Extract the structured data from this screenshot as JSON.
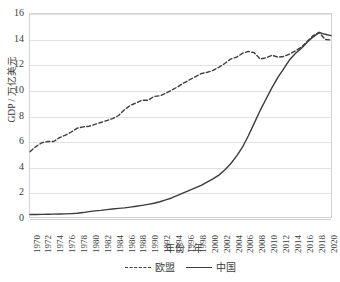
{
  "chart_data": {
    "type": "line",
    "title": "",
    "xlabel": "年份 / 年",
    "ylabel": "GDP / 万亿美元",
    "xlim": [
      1970,
      2021
    ],
    "ylim": [
      0,
      16
    ],
    "yticks": [
      0,
      2,
      4,
      6,
      8,
      10,
      12,
      14,
      16
    ],
    "grid": true,
    "legend_position": "bottom",
    "x": [
      1970,
      1971,
      1972,
      1973,
      1974,
      1975,
      1976,
      1977,
      1978,
      1979,
      1980,
      1981,
      1982,
      1983,
      1984,
      1985,
      1986,
      1987,
      1988,
      1989,
      1990,
      1991,
      1992,
      1993,
      1994,
      1995,
      1996,
      1997,
      1998,
      1999,
      2000,
      2001,
      2002,
      2003,
      2004,
      2005,
      2006,
      2007,
      2008,
      2009,
      2010,
      2011,
      2012,
      2013,
      2014,
      2015,
      2016,
      2017,
      2018,
      2019,
      2020,
      2021
    ],
    "xtick_labels": [
      "1970",
      "1972",
      "1974",
      "1976",
      "1978",
      "1980",
      "1982",
      "1984",
      "1986",
      "1988",
      "1990",
      "1992",
      "1994",
      "1996",
      "1998",
      "2000",
      "2002",
      "2004",
      "2006",
      "2008",
      "2010",
      "2012",
      "2014",
      "2016",
      "2018",
      "2020"
    ],
    "series": [
      {
        "name": "欧盟",
        "style": "dashed",
        "color": "#3b3b3b",
        "values": [
          5.15,
          5.55,
          5.85,
          5.95,
          5.95,
          6.25,
          6.45,
          6.7,
          7.0,
          7.1,
          7.15,
          7.3,
          7.45,
          7.6,
          7.75,
          8.0,
          8.45,
          8.8,
          9.0,
          9.2,
          9.2,
          9.5,
          9.55,
          9.75,
          10.0,
          10.25,
          10.55,
          10.8,
          11.05,
          11.3,
          11.4,
          11.55,
          11.8,
          12.1,
          12.45,
          12.6,
          12.9,
          13.05,
          12.95,
          12.45,
          12.55,
          12.75,
          12.6,
          12.65,
          12.85,
          13.1,
          13.4,
          13.85,
          14.3,
          14.55,
          14.0,
          13.95
        ]
      },
      {
        "name": "中国",
        "style": "solid",
        "color": "#3b3b3b",
        "values": [
          0.2,
          0.2,
          0.21,
          0.22,
          0.23,
          0.24,
          0.25,
          0.27,
          0.3,
          0.35,
          0.42,
          0.48,
          0.52,
          0.58,
          0.63,
          0.68,
          0.72,
          0.78,
          0.85,
          0.92,
          1.0,
          1.08,
          1.2,
          1.35,
          1.5,
          1.7,
          1.9,
          2.1,
          2.3,
          2.5,
          2.75,
          3.0,
          3.3,
          3.7,
          4.2,
          4.8,
          5.5,
          6.4,
          7.4,
          8.4,
          9.3,
          10.2,
          11.0,
          11.7,
          12.4,
          12.9,
          13.3,
          13.8,
          14.2,
          14.55,
          14.4,
          14.3
        ]
      }
    ]
  },
  "axes": {
    "y_title": "GDP / 万亿美元",
    "x_title": "年份 / 年"
  },
  "legend": {
    "items": [
      {
        "label": "欧盟",
        "style": "dashed"
      },
      {
        "label": "中国",
        "style": "solid"
      }
    ]
  }
}
